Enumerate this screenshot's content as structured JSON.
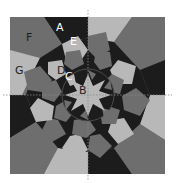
{
  "diagram": {
    "type": "quilt-block-pattern",
    "colors": {
      "dark": "#1c1c1c",
      "medium": "#6e6e6e",
      "light": "#b8b8b8",
      "mid_dark": "#4a4a4a",
      "background": "#ffffff",
      "guide": "#8a8a8a"
    },
    "labels": [
      {
        "id": "A",
        "text": "A",
        "x": 56,
        "y": 31
      },
      {
        "id": "B",
        "text": "B",
        "x": 79,
        "y": 94
      },
      {
        "id": "C",
        "text": "C",
        "x": 65,
        "y": 80
      },
      {
        "id": "D",
        "text": "D",
        "x": 57,
        "y": 74
      },
      {
        "id": "E",
        "text": "E",
        "x": 70,
        "y": 45
      },
      {
        "id": "F",
        "text": "F",
        "x": 26,
        "y": 41
      },
      {
        "id": "G",
        "text": "G",
        "x": 15,
        "y": 74
      }
    ],
    "guides": {
      "vertical_x": 88,
      "horizontal_y": 95
    }
  }
}
